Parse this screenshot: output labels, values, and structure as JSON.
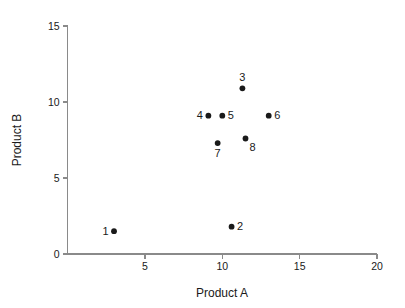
{
  "chart_data": {
    "type": "scatter",
    "title": "",
    "xlabel": "Product A",
    "ylabel": "Product B",
    "xlim": [
      0,
      20
    ],
    "ylim": [
      0,
      15
    ],
    "xticks": [
      5,
      10,
      15,
      20
    ],
    "yticks": [
      0,
      5,
      10,
      15
    ],
    "xtick_labels": [
      "5",
      "10",
      "15",
      "20"
    ],
    "ytick_labels": [
      "0",
      "5",
      "10",
      "15"
    ],
    "grid": false,
    "legend": "none",
    "marker": "filled-circle",
    "marker_color": "#1a1a1a",
    "axis_color": "#8a8a8a",
    "background": "#ffffff",
    "points": [
      {
        "label": "1",
        "x": 3.0,
        "y": 1.5,
        "label_pos": "left"
      },
      {
        "label": "2",
        "x": 10.6,
        "y": 1.8,
        "label_pos": "right"
      },
      {
        "label": "3",
        "x": 11.3,
        "y": 10.9,
        "label_pos": "above"
      },
      {
        "label": "4",
        "x": 9.1,
        "y": 9.1,
        "label_pos": "left"
      },
      {
        "label": "5",
        "x": 10.0,
        "y": 9.1,
        "label_pos": "right"
      },
      {
        "label": "6",
        "x": 13.0,
        "y": 9.1,
        "label_pos": "right"
      },
      {
        "label": "7",
        "x": 9.7,
        "y": 7.3,
        "label_pos": "below"
      },
      {
        "label": "8",
        "x": 11.5,
        "y": 7.6,
        "label_pos": "below-right"
      }
    ]
  }
}
